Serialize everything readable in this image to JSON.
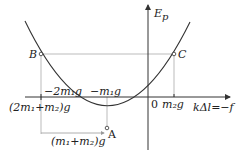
{
  "diagram": {
    "y_axis_label": "E",
    "y_axis_sub": "p",
    "x_axis_label": "kΔl=−f",
    "origin_label": "0",
    "points": {
      "A": "A",
      "B": "B",
      "C": "C"
    },
    "tick_labels": {
      "neg_2m1g": "−2m₁g",
      "neg_m1g": "−m₁g",
      "m2g": "m₂g",
      "sum_2m1_m2": "(2m₁+m₂)g",
      "span_m1_m2": "(m₁+m₂)g"
    },
    "colors": {
      "curve": "#333333",
      "axis": "#333333",
      "guide": "#999999",
      "text": "#222222"
    }
  }
}
